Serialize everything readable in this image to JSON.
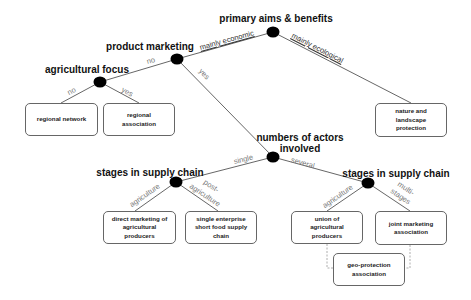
{
  "diagram": {
    "type": "decision-tree",
    "decision_nodes": [
      {
        "id": "root",
        "label": "primary aims & benefits",
        "x": 273,
        "y": 32
      },
      {
        "id": "product",
        "label": "product marketing",
        "x": 177,
        "y": 59
      },
      {
        "id": "agri",
        "label": "agricultural focus",
        "x": 100,
        "y": 82
      },
      {
        "id": "actors",
        "label_line1": "numbers of actors",
        "label_line2": "involved",
        "x": 273,
        "y": 157
      },
      {
        "id": "stagesL",
        "label": "stages in supply chain",
        "x": 176,
        "y": 182
      },
      {
        "id": "stagesR",
        "label": "stages in supply chain",
        "x": 368,
        "y": 183
      }
    ],
    "edge_labels": {
      "mainly_economic": "mainly economic",
      "mainly_ecological": "mainly ecological",
      "product_no": "no",
      "product_yes": "yes",
      "agri_no": "no",
      "agri_yes": "yes",
      "single": "single",
      "several": "several",
      "left_agriculture": "agriculture",
      "post_agriculture_line1": "post-",
      "post_agriculture_line2": "agriculture",
      "right_agriculture": "agriculture",
      "multi_stages_line1": "multi-",
      "multi_stages_line2": "stages"
    },
    "outcomes": {
      "regional_network": "regional network",
      "regional_association": "regional association",
      "nature_protection": "nature and landscape protection",
      "direct_marketing": "direct marketing of agricultural producers",
      "single_enterprise": "single enterprise short food supply chain",
      "union_producers": "union of agricultural producers",
      "joint_marketing": "joint marketing association",
      "geo_protection": "geo-protection association"
    },
    "colors": {
      "node_fill": "#000000",
      "edge_stroke": "#555555",
      "box_border": "#666666",
      "dashed_stroke": "#999999",
      "edge_label": "#777777"
    }
  }
}
